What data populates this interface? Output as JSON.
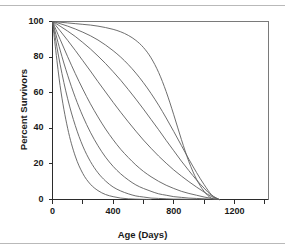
{
  "chart_data": {
    "type": "line",
    "title": "",
    "xlabel": "Age (Days)",
    "ylabel": "Percent Survivors",
    "xlim": [
      0,
      1425
    ],
    "ylim": [
      0,
      100
    ],
    "grid": false,
    "legend": "none",
    "xticks": [
      0,
      200,
      400,
      600,
      800,
      1000,
      1200,
      1400
    ],
    "xtick_labels": [
      "0",
      "",
      "400",
      "",
      "800",
      "",
      "1200",
      ""
    ],
    "yticks": [
      0,
      20,
      40,
      60,
      80,
      100
    ],
    "ytick_labels": [
      "0",
      "20",
      "40",
      "60",
      "80",
      "100"
    ],
    "x": [
      0,
      50,
      100,
      150,
      200,
      250,
      300,
      350,
      400,
      450,
      500,
      550,
      600,
      650,
      700,
      750,
      800,
      850,
      900,
      950,
      1000,
      1050,
      1100
    ],
    "series": [
      {
        "name": "cohort-1",
        "values": [
          100,
          99.6,
          99.2,
          98.8,
          98.4,
          98.0,
          97.4,
          96.6,
          95.6,
          94.2,
          92.2,
          89.4,
          85.4,
          79.6,
          71.4,
          60.6,
          47.6,
          33.8,
          21.2,
          11.4,
          4.6,
          0.6,
          0
        ]
      },
      {
        "name": "cohort-2",
        "values": [
          100,
          98.8,
          97.4,
          95.8,
          94.0,
          92.0,
          89.6,
          86.8,
          83.6,
          80.0,
          75.8,
          71.0,
          65.6,
          59.6,
          53.0,
          45.8,
          38.2,
          30.4,
          22.6,
          15.2,
          8.4,
          2.6,
          0
        ]
      },
      {
        "name": "cohort-3",
        "values": [
          100,
          97.4,
          94.6,
          91.6,
          88.2,
          84.6,
          80.6,
          76.4,
          71.8,
          67.0,
          61.8,
          56.4,
          50.8,
          45.0,
          39.2,
          33.2,
          27.4,
          21.6,
          16.2,
          11.0,
          6.4,
          2.2,
          0
        ]
      },
      {
        "name": "cohort-4",
        "values": [
          100,
          94.8,
          89.4,
          83.8,
          78.0,
          72.2,
          66.2,
          60.4,
          54.6,
          49.0,
          43.6,
          38.4,
          33.4,
          28.8,
          24.4,
          20.4,
          16.6,
          13.2,
          10.0,
          7.0,
          4.2,
          1.6,
          0
        ]
      },
      {
        "name": "cohort-5",
        "values": [
          100,
          90.0,
          80.2,
          70.8,
          62.0,
          53.8,
          46.4,
          39.6,
          33.6,
          28.2,
          23.6,
          19.4,
          15.8,
          12.8,
          10.2,
          8.0,
          6.2,
          4.6,
          3.4,
          2.4,
          1.4,
          0.6,
          0
        ]
      },
      {
        "name": "cohort-6",
        "values": [
          100,
          84.0,
          69.8,
          57.4,
          46.8,
          37.8,
          30.2,
          23.8,
          18.6,
          14.4,
          11.0,
          8.2,
          6.2,
          4.6,
          3.2,
          2.4,
          1.6,
          1.2,
          0.8,
          0.6,
          0.4,
          0.2,
          0
        ]
      },
      {
        "name": "cohort-7",
        "values": [
          100,
          76.0,
          56.6,
          41.6,
          30.0,
          21.4,
          15.0,
          10.4,
          7.0,
          4.8,
          3.2,
          2.0,
          1.4,
          0.8,
          0.6,
          0.4,
          0.2,
          0.2,
          0.1,
          0.1,
          0,
          0,
          0
        ]
      },
      {
        "name": "cohort-8",
        "values": [
          100,
          64.0,
          40.0,
          24.4,
          14.6,
          8.6,
          5.0,
          2.8,
          1.6,
          0.8,
          0.4,
          0.2,
          0.1,
          0,
          0,
          0,
          0,
          0,
          0,
          0,
          0,
          0,
          0
        ]
      }
    ]
  },
  "figure": {
    "axis_color": "#2b2b2b",
    "curve_color": "#5d5d5d",
    "frame_color": "#7a7a7a",
    "background": "#ffffff"
  }
}
